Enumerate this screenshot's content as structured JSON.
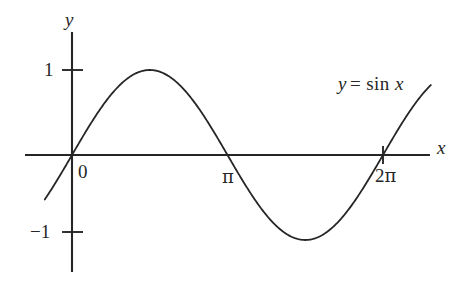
{
  "figure": {
    "title": "",
    "background_color": "#ffffff",
    "ink_color": "#262626",
    "axis_x_label": "x",
    "axis_y_label": "y",
    "origin_label": "0",
    "curve_label_lhs": "y",
    "curve_label_operator": "=",
    "curve_label_function": "sin",
    "curve_label_variable": "x",
    "y_tick_top_label": "1",
    "y_tick_bottom_label": "−1",
    "x_tick_pi_label": "π",
    "x_tick_2pi_label": "2π",
    "x_tick_2pi_number": "2"
  },
  "chart_data": {
    "type": "line",
    "title": "",
    "subtitle": "",
    "xlabel": "x",
    "ylabel": "y",
    "annotations": [
      "y = sin x"
    ],
    "legend": [],
    "legend_position": "none",
    "grid": false,
    "xlim": [
      -0.55,
      7.25
    ],
    "ylim": [
      -1.98,
      1.98
    ],
    "xticks": [
      0,
      3.141592653589793,
      6.283185307179586
    ],
    "xtick_labels": [
      "0",
      "π",
      "2π"
    ],
    "yticks": [
      -1,
      1
    ],
    "ytick_labels": [
      "−1",
      "1"
    ],
    "series": [
      {
        "name": "y = sin x",
        "equation": "y = sin(x)",
        "color": "#262626",
        "linewidth": 1.8,
        "x": [
          -0.55,
          -0.3,
          0,
          0.3925,
          0.7854,
          1.1781,
          1.5708,
          1.9635,
          2.3562,
          2.7489,
          3.1416,
          3.5343,
          3.927,
          4.3197,
          4.7124,
          5.1051,
          5.4978,
          5.8905,
          6.2832,
          6.6759,
          7.0686,
          7.25
        ],
        "y": [
          -0.5227,
          -0.2955,
          0,
          0.3827,
          0.7071,
          0.9239,
          1,
          0.9239,
          0.7071,
          0.3827,
          0,
          -0.3827,
          -0.7071,
          -0.9239,
          -1,
          -0.9239,
          -0.7071,
          -0.3827,
          0,
          0.3827,
          0.7071,
          0.8347
        ]
      }
    ]
  }
}
